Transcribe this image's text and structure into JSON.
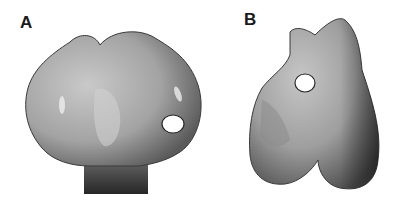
{
  "figure": {
    "panels": [
      {
        "label": "A",
        "view": "bone specimen view A with white circular marker"
      },
      {
        "label": "B",
        "view": "bone specimen view B with white circular marker"
      }
    ],
    "colors": {
      "background": "#ffffff",
      "bone_light": "#c8c8c8",
      "bone_mid": "#9a9a9a",
      "bone_dark": "#3a3a3a",
      "marker_fill": "#ffffff",
      "marker_stroke": "#2a2a2a"
    }
  }
}
